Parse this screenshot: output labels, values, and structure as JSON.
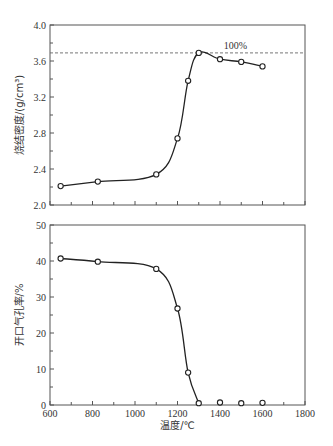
{
  "chart_data": [
    {
      "type": "line",
      "title": "",
      "xlabel": "",
      "ylabel": "烧结密度/(g/cm³)",
      "x": [
        650,
        825,
        1100,
        1200,
        1250,
        1300,
        1400,
        1500,
        1600
      ],
      "series": [
        {
          "name": "烧结密度",
          "values": [
            2.21,
            2.26,
            2.34,
            2.74,
            3.38,
            3.69,
            3.62,
            3.59,
            3.54
          ]
        }
      ],
      "xlim": [
        600,
        1800
      ],
      "ylim": [
        2.0,
        4.0
      ],
      "yticks": [
        "2.0",
        "2.4",
        "2.8",
        "3.2",
        "3.6",
        "4.0"
      ],
      "reference_line": {
        "y": 3.69,
        "label": "100%",
        "style": "dashed"
      },
      "markers": "open-circle",
      "grid": false
    },
    {
      "type": "line",
      "title": "",
      "xlabel": "温度/℃",
      "ylabel": "开口气孔率/%",
      "x": [
        650,
        825,
        1100,
        1200,
        1250,
        1300,
        1400,
        1500,
        1600
      ],
      "series": [
        {
          "name": "开口气孔率",
          "values": [
            40.7,
            39.8,
            37.8,
            26.8,
            9.0,
            0.5,
            0.7,
            0.5,
            0.6
          ]
        }
      ],
      "xlim": [
        600,
        1800
      ],
      "ylim": [
        0,
        50
      ],
      "xticks": [
        "600",
        "800",
        "1000",
        "1200",
        "1400",
        "1600",
        "1800"
      ],
      "yticks": [
        "0",
        "10",
        "20",
        "30",
        "40",
        "50"
      ],
      "markers": "open-circle",
      "grid": false
    }
  ],
  "labels": {
    "top_ylabel": "烧结密度/(g/cm³)",
    "bottom_ylabel": "开口气孔率/%",
    "xlabel": "温度/℃",
    "ref_label": "100%"
  }
}
